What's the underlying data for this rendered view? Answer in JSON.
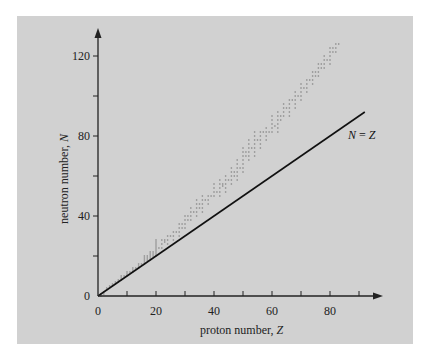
{
  "chart_data": {
    "type": "scatter",
    "title": "",
    "xlabel": "proton number, Z",
    "ylabel": "neutron number, N",
    "xlabel_text": "proton number, ",
    "xlabel_var": "Z",
    "ylabel_text": "neutron number, ",
    "ylabel_var": "N",
    "xlim": [
      0,
      95
    ],
    "ylim": [
      0,
      132
    ],
    "x_ticks": [
      0,
      10,
      20,
      30,
      40,
      50,
      60,
      70,
      80,
      90
    ],
    "x_tick_labels": [
      "0",
      "",
      "20",
      "",
      "40",
      "",
      "60",
      "",
      "80",
      ""
    ],
    "y_ticks": [
      0,
      20,
      40,
      60,
      80,
      100,
      120
    ],
    "y_tick_labels": [
      "0",
      "",
      "40",
      "",
      "80",
      "",
      "120"
    ],
    "grid": false,
    "series": [
      {
        "name": "stable nuclides",
        "kind": "scatter",
        "color": "#8a8a8a",
        "ranges_Z_Nmin_Nmax": [
          [
            1,
            0,
            1
          ],
          [
            2,
            1,
            2
          ],
          [
            3,
            3,
            4
          ],
          [
            4,
            5,
            5
          ],
          [
            5,
            5,
            6
          ],
          [
            6,
            6,
            7
          ],
          [
            7,
            7,
            8
          ],
          [
            8,
            8,
            10
          ],
          [
            9,
            10,
            10
          ],
          [
            10,
            10,
            12
          ],
          [
            11,
            12,
            12
          ],
          [
            12,
            12,
            14
          ],
          [
            13,
            14,
            14
          ],
          [
            14,
            14,
            16
          ],
          [
            15,
            16,
            16
          ],
          [
            16,
            16,
            20
          ],
          [
            17,
            18,
            20
          ],
          [
            18,
            18,
            22
          ],
          [
            19,
            20,
            22
          ],
          [
            20,
            20,
            28
          ],
          [
            21,
            24,
            24
          ],
          [
            22,
            24,
            28
          ],
          [
            23,
            27,
            28
          ],
          [
            24,
            26,
            30
          ],
          [
            25,
            30,
            30
          ],
          [
            26,
            28,
            32
          ],
          [
            27,
            32,
            32
          ],
          [
            28,
            30,
            36
          ],
          [
            29,
            34,
            36
          ],
          [
            30,
            34,
            40
          ],
          [
            31,
            38,
            40
          ],
          [
            32,
            38,
            44
          ],
          [
            33,
            42,
            42
          ],
          [
            34,
            40,
            48
          ],
          [
            35,
            44,
            46
          ],
          [
            36,
            42,
            50
          ],
          [
            37,
            48,
            48
          ],
          [
            38,
            46,
            50
          ],
          [
            39,
            50,
            50
          ],
          [
            40,
            50,
            56
          ],
          [
            41,
            52,
            52
          ],
          [
            42,
            50,
            58
          ],
          [
            43,
            55,
            56
          ],
          [
            44,
            52,
            60
          ],
          [
            45,
            58,
            58
          ],
          [
            46,
            56,
            64
          ],
          [
            47,
            60,
            62
          ],
          [
            48,
            58,
            68
          ],
          [
            49,
            64,
            64
          ],
          [
            50,
            62,
            74
          ],
          [
            51,
            70,
            72
          ],
          [
            52,
            68,
            78
          ],
          [
            53,
            74,
            74
          ],
          [
            54,
            70,
            82
          ],
          [
            55,
            78,
            78
          ],
          [
            56,
            74,
            82
          ],
          [
            57,
            82,
            82
          ],
          [
            58,
            78,
            84
          ],
          [
            59,
            82,
            82
          ],
          [
            60,
            82,
            90
          ],
          [
            61,
            85,
            85
          ],
          [
            62,
            82,
            92
          ],
          [
            63,
            88,
            90
          ],
          [
            64,
            90,
            96
          ],
          [
            65,
            94,
            94
          ],
          [
            66,
            90,
            98
          ],
          [
            67,
            98,
            98
          ],
          [
            68,
            94,
            102
          ],
          [
            69,
            100,
            100
          ],
          [
            70,
            98,
            106
          ],
          [
            71,
            104,
            104
          ],
          [
            72,
            102,
            108
          ],
          [
            73,
            108,
            108
          ],
          [
            74,
            106,
            112
          ],
          [
            75,
            110,
            112
          ],
          [
            76,
            110,
            116
          ],
          [
            77,
            114,
            116
          ],
          [
            78,
            114,
            120
          ],
          [
            79,
            118,
            118
          ],
          [
            80,
            116,
            124
          ],
          [
            81,
            122,
            124
          ],
          [
            82,
            122,
            126
          ],
          [
            83,
            126,
            126
          ]
        ]
      },
      {
        "name": "N = Z",
        "kind": "line",
        "color": "#111111",
        "x": [
          0,
          92
        ],
        "y": [
          0,
          92
        ],
        "label": "N = Z",
        "label_lhs": "N",
        "label_op": " = ",
        "label_rhs": "Z"
      }
    ],
    "legend": null
  },
  "annotations": {
    "line_label_lhs": "N",
    "line_label_op": " = ",
    "line_label_rhs": "Z"
  }
}
